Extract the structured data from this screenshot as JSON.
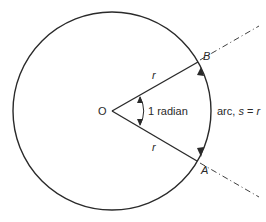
{
  "diagram": {
    "labels": {
      "origin": "O",
      "point_b": "B",
      "point_a": "A",
      "radius_upper": "r",
      "radius_lower": "r",
      "angle": "1 radian",
      "arc_prefix": "arc, ",
      "arc_s": "s",
      "arc_eq": " = ",
      "arc_r": "r"
    },
    "colors": {
      "stroke": "#2a2a2a",
      "background": "#ffffff"
    }
  }
}
